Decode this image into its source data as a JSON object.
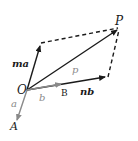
{
  "diagram": {
    "colors": {
      "main": "#1a1a1a",
      "grey": "#8a8a8a"
    },
    "points": {
      "O": {
        "label": "O",
        "x": 27,
        "y": 90
      },
      "A": {
        "label": "A",
        "x": 16,
        "y": 124
      },
      "B": {
        "label": "B",
        "x": 62,
        "y": 84
      },
      "P": {
        "label": "P",
        "x": 119,
        "y": 28
      },
      "ma_tip": {
        "x": 41,
        "y": 43
      },
      "nb_tip": {
        "x": 108,
        "y": 77
      }
    },
    "labels": {
      "O": "O",
      "A": "A",
      "B": "B",
      "P": "P",
      "a": "a",
      "b": "b",
      "p": "p",
      "ma": "ma",
      "nb": "nb"
    }
  }
}
